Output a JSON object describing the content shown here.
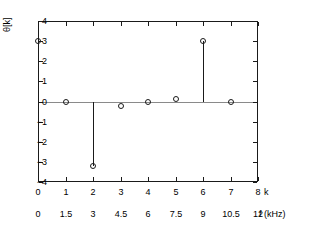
{
  "chart_data": {
    "type": "line",
    "plot_style": "stem",
    "title": "",
    "xlabel": "k",
    "ylabel": "θ[k]",
    "secondary_xlabel": "f (kHz)",
    "x": [
      0,
      1,
      2,
      3,
      4,
      5,
      6,
      7
    ],
    "values": [
      3.0,
      0.0,
      -3.2,
      -0.2,
      0.0,
      0.1,
      3.0,
      0.0
    ],
    "series": [
      {
        "name": "θ[k]",
        "values": [
          3.0,
          0.0,
          -3.2,
          -0.2,
          0.0,
          0.1,
          3.0,
          0.0
        ]
      }
    ],
    "xlim": [
      0,
      8
    ],
    "ylim": [
      -4,
      4
    ],
    "xticks": [
      0,
      1,
      2,
      3,
      4,
      5,
      6,
      7,
      8
    ],
    "xtick_labels": [
      "0",
      "1",
      "2",
      "3",
      "4",
      "5",
      "6",
      "7",
      "8"
    ],
    "yticks": [
      -4,
      -3,
      -2,
      -1,
      0,
      1,
      2,
      3,
      4
    ],
    "ytick_labels": [
      "−4",
      "−3",
      "−2",
      "−1",
      "0",
      "1",
      "2",
      "3",
      "4"
    ],
    "secondary_xticks": [
      0,
      1.5,
      3,
      4.5,
      6,
      7.5,
      9,
      10.5,
      12
    ],
    "secondary_xtick_labels": [
      "0",
      "1.5",
      "3",
      "4.5",
      "6",
      "7.5",
      "9",
      "10.5",
      "12"
    ],
    "grid": false,
    "legend": null,
    "marker": "open-circle",
    "colors": {
      "axis": "#1a1a1a",
      "data": "#1a1a1a",
      "zero_line": "#8a8a8a",
      "background": "#ffffff"
    }
  }
}
